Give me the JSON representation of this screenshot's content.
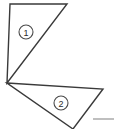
{
  "figure": {
    "width": 114,
    "height": 129,
    "background_color": "#ffffff",
    "stroke_color": "#3a3a3a",
    "stroke_width": 1.4,
    "label_circle_stroke": "#4a4a4a",
    "label_text_color": "#2b2b2b",
    "accent_gray": "#b0b0b0"
  },
  "shapes": [
    {
      "name": "triangle-one",
      "label": "1",
      "points": "10,4 67,4 7,83",
      "label_cx": 26,
      "label_cy": 32,
      "label_r": 7
    },
    {
      "name": "triangle-two",
      "label": "2",
      "points": "7,83 103,89 73,129",
      "label_cx": 61,
      "label_cy": 103,
      "label_r": 7
    }
  ],
  "segments": [
    {
      "name": "gray-baseline-segment",
      "x1": 93,
      "y1": 119,
      "x2": 114,
      "y2": 119,
      "color": "#b0b0b0",
      "width": 1.6
    }
  ],
  "labels": {
    "one": "1",
    "two": "2"
  }
}
